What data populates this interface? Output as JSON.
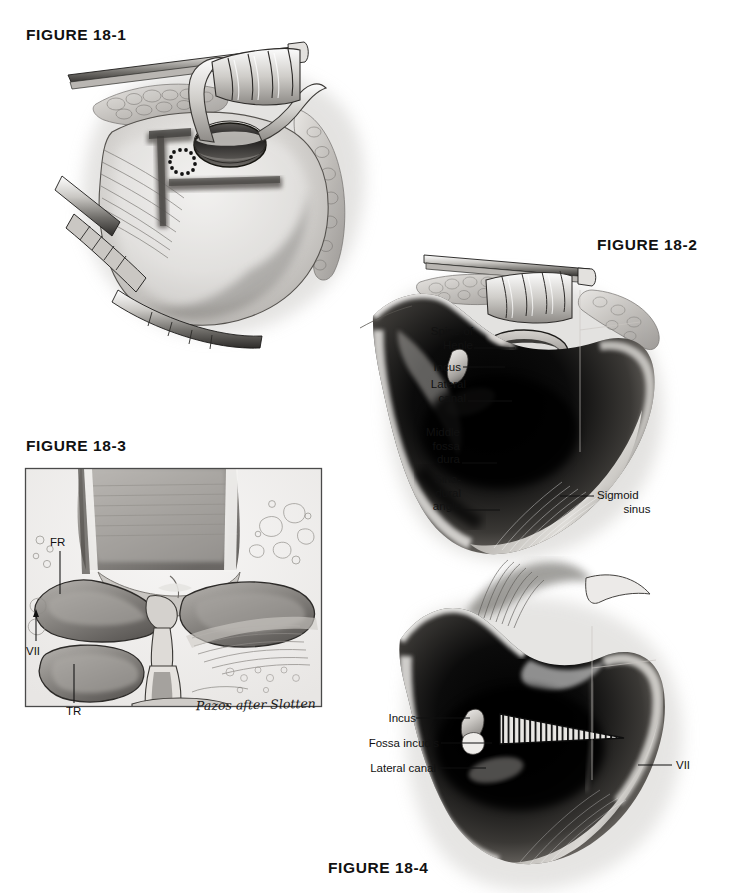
{
  "page": {
    "width": 739,
    "height": 893,
    "background": "#ffffff",
    "ink": "#111111",
    "kind": "medical-illustration-plate"
  },
  "figures": [
    {
      "id": "fig-18-1",
      "caption": "FIGURE 18-1",
      "caption_pos": {
        "x": 26,
        "y": 26
      },
      "description": "Postauricular exposure with T-shaped periosteal incision, ear canal opening and retractor blades",
      "labels": []
    },
    {
      "id": "fig-18-2",
      "caption": "FIGURE 18-2",
      "caption_pos": {
        "x": 597,
        "y": 236
      },
      "description": "Completed mastoidectomy cavity showing landmarks",
      "labels": [
        {
          "name": "spine-of-henle",
          "text_line1": "Spine of",
          "text_line2": "Henle",
          "x": 433,
          "y": 330,
          "leader_to_x": 515,
          "leader_y": 348
        },
        {
          "name": "incus",
          "text_line1": "Incus",
          "text_line2": "",
          "x": 433,
          "y": 361,
          "leader_to_x": 505,
          "leader_y": 367
        },
        {
          "name": "lateral-canal",
          "text_line1": "Lateral",
          "text_line2": "canal",
          "x": 433,
          "y": 383,
          "leader_to_x": 512,
          "leader_y": 401
        },
        {
          "name": "middle-fossa-dura",
          "text_line1": "Middle",
          "text_line2": "fossa",
          "text_line3": "dura",
          "x": 433,
          "y": 431,
          "leader_to_x": 497,
          "leader_y": 463
        },
        {
          "name": "sino-dural-angle",
          "text_line1": "Sino-",
          "text_line2": "dural",
          "text_line3": "angle",
          "x": 433,
          "y": 478,
          "leader_to_x": 500,
          "leader_y": 510
        },
        {
          "name": "sigmoid-sinus",
          "text_line1": "Sigmoid",
          "text_line2": "sinus",
          "x": 597,
          "y": 489,
          "leader_from_x": 560,
          "leader_y": 496,
          "align": "left"
        }
      ]
    },
    {
      "id": "fig-18-3",
      "caption": "FIGURE 18-3",
      "caption_pos": {
        "x": 26,
        "y": 437
      },
      "description": "Inset anatomic drawing of temporal bone landmarks within bordered panel",
      "panel": {
        "x": 25,
        "y": 468,
        "width": 297,
        "height": 239
      },
      "signature": "Pazos after Slotten",
      "signature_pos": {
        "x": 196,
        "y": 697
      },
      "labels": [
        {
          "name": "fr",
          "text_line1": "FR",
          "x": 50,
          "y": 538,
          "leader_x": 60,
          "leader_y1": 550,
          "leader_y2": 592
        },
        {
          "name": "vii",
          "text_line1": "VII",
          "x": 26,
          "y": 645,
          "leader_x": 36,
          "leader_y1": 643,
          "leader_y2": 610,
          "arrow": "up"
        },
        {
          "name": "tr",
          "text_line1": "TR",
          "x": 66,
          "y": 707,
          "leader_x": 74,
          "leader_y1": 705,
          "leader_y2": 662,
          "arrow": "none"
        }
      ]
    },
    {
      "id": "fig-18-4",
      "caption": "FIGURE 18-4",
      "caption_pos": {
        "x": 328,
        "y": 859
      },
      "description": "Mastoidectomy cavity with hatched wedge over fossa incudis and facial nerve course",
      "labels": [
        {
          "name": "incus",
          "text_line1": "Incus",
          "x": 380,
          "y": 712,
          "leader_to_x": 470,
          "leader_y": 718,
          "align": "right"
        },
        {
          "name": "fossa-incudis",
          "text_line1": "Fossa incudis",
          "x": 358,
          "y": 737,
          "leader_to_x": 482,
          "leader_y": 743,
          "align": "right"
        },
        {
          "name": "lateral-canal",
          "text_line1": "Lateral canal",
          "x": 363,
          "y": 762,
          "leader_to_x": 480,
          "leader_y": 768,
          "align": "right"
        },
        {
          "name": "vii",
          "text_line1": "VII",
          "x": 676,
          "y": 759,
          "leader_from_x": 638,
          "leader_y": 765,
          "align": "left"
        }
      ]
    }
  ]
}
